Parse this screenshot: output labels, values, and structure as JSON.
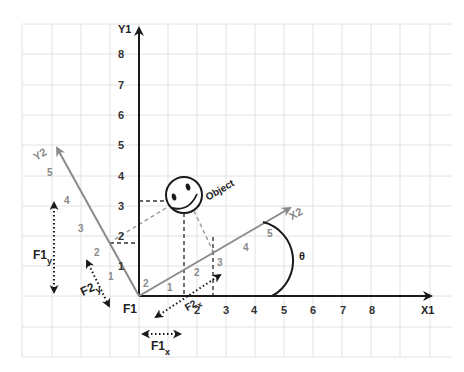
{
  "diagram": {
    "colors": {
      "background": "#ffffff",
      "grid": "#e2e2e2",
      "primary_axes": "#1a1a1a",
      "rotated_axes": "#8a8a8a",
      "dashed_projection": "#333333",
      "dashed_projection_rotated": "#9a9a9a"
    },
    "primary_frame": {
      "origin_label": "F1",
      "x_axis_label": "X1",
      "y_axis_label": "Y1",
      "x_ticks": [
        "1",
        "2",
        "3",
        "4",
        "5",
        "6",
        "7",
        "8"
      ],
      "y_ticks": [
        "1",
        "2",
        "3",
        "4",
        "5",
        "6",
        "7",
        "8"
      ]
    },
    "rotated_frame": {
      "x_axis_label": "X2",
      "y_axis_label": "Y2",
      "x_ticks": [
        "1",
        "2",
        "3",
        "4",
        "5"
      ],
      "y_ticks": [
        "1",
        "2",
        "3",
        "4",
        "5"
      ],
      "origin_tick": "2"
    },
    "angle_label": "θ",
    "object_label": "Object",
    "components": {
      "f1x": {
        "main": "F1",
        "sub": "x"
      },
      "f1y": {
        "main": "F1",
        "sub": "y"
      },
      "f2x": {
        "main": "F2",
        "sub": "x"
      },
      "f2y": {
        "main": "F2",
        "sub": "y"
      }
    }
  }
}
